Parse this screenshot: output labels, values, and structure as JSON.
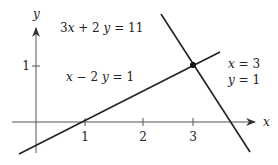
{
  "diagram": {
    "type": "linear-system-graph",
    "axes": {
      "x_label": "x",
      "y_label": "y",
      "x_ticks": [
        "1",
        "2",
        "3"
      ],
      "y_ticks": [
        "1"
      ]
    },
    "lines": [
      {
        "equation": "3x + 2y = 11",
        "label_text_left": "3",
        "label_text_mid": " + 2",
        "label_text_eq": " = 11"
      },
      {
        "equation": "x − 2y = 1",
        "label_text_mid": " − 2",
        "label_text_eq": " = 1"
      }
    ],
    "solution": {
      "x_text": "x",
      "x_eq": " = 3",
      "y_text": "y",
      "y_eq": " = 1"
    },
    "colors": {
      "line": "#222222",
      "axis": "#555555",
      "background": "#ffffff"
    }
  }
}
